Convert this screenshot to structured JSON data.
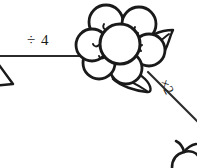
{
  "page": {
    "background_color": "#ffffff",
    "ink_color": "#1a1a1a",
    "width": 197,
    "height": 168
  },
  "edges": {
    "horizontal": {
      "label": "÷ 4",
      "operation": "divide",
      "operand": "4",
      "from_node": "triangle-node-partial",
      "to_node": "flower-node"
    },
    "diagonal": {
      "label": "×2",
      "operation": "multiply",
      "operand": "2",
      "from_node": "flower-node",
      "to_node": "bottom-right-node-partial"
    }
  },
  "nodes": {
    "triangle": {
      "name": "triangle-node-partial",
      "description": "partial triangle shape cropped at left edge"
    },
    "flower": {
      "name": "flower-node",
      "description": "six round petals around a center circle with two leaves",
      "petal_count": 6,
      "leaf_count": 2
    },
    "bottom_right": {
      "name": "bottom-right-node-partial",
      "description": "partial shape cropped at bottom right corner"
    }
  }
}
